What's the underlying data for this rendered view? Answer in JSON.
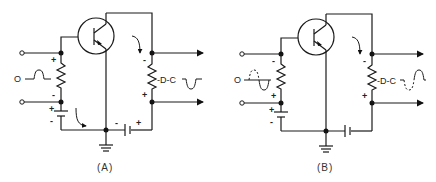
{
  "diagram": {
    "colors": {
      "line": "#1a1a1a",
      "background": "#ffffff"
    },
    "panels": [
      {
        "id": "A",
        "caption": "(A)",
        "input_label": "O",
        "output_label": "-D-C",
        "input_resistor_signs": {
          "top": "+",
          "bottom": "-"
        },
        "input_battery_signs": {
          "top": "+",
          "bottom": "-"
        },
        "output_resistor_signs": {
          "top": "-",
          "bottom": "+"
        },
        "collector_battery_signs": {
          "left": "-",
          "right": "+"
        },
        "input_waveform": "positive-pulse",
        "output_waveform": "negative-pulse"
      },
      {
        "id": "B",
        "caption": "(B)",
        "input_label": "O",
        "output_label": "-D-C",
        "input_resistor_signs": {
          "top": "-",
          "bottom": "+"
        },
        "input_battery_signs": {
          "top": "+",
          "bottom": "-"
        },
        "output_resistor_signs": {
          "top": "-",
          "bottom": "+"
        },
        "input_waveform": "sine-dashed-positive-half",
        "output_waveform": "sine-dashed-negative-half"
      }
    ]
  }
}
